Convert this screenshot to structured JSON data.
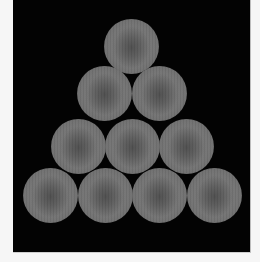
{
  "image": {
    "description": "Triangular arrangement of ten gray textured discs on a black background",
    "background_color": "#030303",
    "margin_color": "#f6f6f6",
    "disc_color": "#737373",
    "disc_center_color": "#545454",
    "panel": {
      "x": 13,
      "y": 0,
      "width": 237,
      "height": 252
    },
    "disc_radius": 27.5,
    "rows": [
      {
        "count": 1,
        "centers": [
          [
            131,
            46
          ]
        ]
      },
      {
        "count": 2,
        "centers": [
          [
            104,
            93
          ],
          [
            159,
            93
          ]
        ]
      },
      {
        "count": 3,
        "centers": [
          [
            78,
            146
          ],
          [
            132,
            146
          ],
          [
            186,
            146
          ]
        ]
      },
      {
        "count": 4,
        "centers": [
          [
            50,
            195
          ],
          [
            105,
            195
          ],
          [
            159,
            195
          ],
          [
            214,
            195
          ]
        ]
      }
    ],
    "total_discs": 10
  }
}
